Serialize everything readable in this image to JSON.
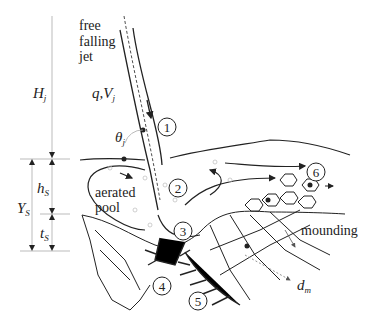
{
  "diagram": {
    "labels": {
      "jet_line1": "free",
      "jet_line2": "falling",
      "jet_line3": "jet",
      "Hj": "H",
      "Hj_sub": "j",
      "qVj": "q,V",
      "qVj_sub": "j",
      "theta": "θ",
      "theta_sub": "j",
      "hs": "h",
      "hs_sub": "S",
      "Ys": "Y",
      "Ys_sub": "S",
      "ts": "t",
      "ts_sub": "S",
      "aerated1": "aerated",
      "aerated2": "pool",
      "mounding": "mounding",
      "dm": "d",
      "dm_sub": "m"
    },
    "process_markers": [
      "1",
      "2",
      "3",
      "4",
      "5",
      "6"
    ],
    "colors": {
      "line": "#222222",
      "dim": "#999999",
      "bubble": "#bbbbbb"
    }
  }
}
